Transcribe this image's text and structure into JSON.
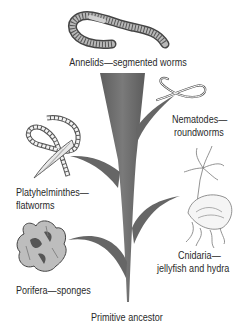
{
  "diagram": {
    "type": "phylogenetic-tree",
    "trunk_color": "#6b6b6b",
    "root": {
      "label": "Primitive ancestor"
    },
    "branches": [
      {
        "id": "porifera",
        "name": "Porifera",
        "common": "sponges",
        "label": "Porifera—sponges",
        "side": "left"
      },
      {
        "id": "cnidaria",
        "name": "Cnidaria",
        "common": "jellyfish and hydra",
        "line1": "Cnidaria—",
        "line2": "jellyfish and hydra",
        "side": "right"
      },
      {
        "id": "platyhelminthes",
        "name": "Platyhelminthes",
        "common": "flatworms",
        "line1": "Platyhelminthes—",
        "line2": "flatworms",
        "side": "left"
      },
      {
        "id": "nematodes",
        "name": "Nematodes",
        "common": "roundworms",
        "line1": "Nematodes—",
        "line2": "roundworms",
        "side": "right"
      },
      {
        "id": "annelids",
        "name": "Annelids",
        "common": "segmented worms",
        "label": "Annelids—segmented worms",
        "side": "top"
      }
    ]
  }
}
